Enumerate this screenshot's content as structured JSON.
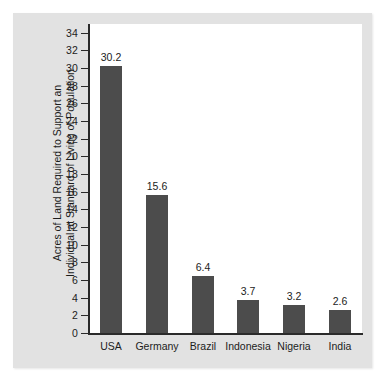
{
  "chart_data": {
    "type": "bar",
    "title": "",
    "subtitle": "",
    "xlabel": "",
    "ylabel": "Acres of Land Required to Support an Individual at Standard of Living of Population",
    "ylabel_lines": [
      "Acres of Land Required to Support an",
      "Individual at Standard of Living of Population"
    ],
    "categories": [
      "USA",
      "Germany",
      "Brazil",
      "Indonesia",
      "Nigeria",
      "India"
    ],
    "values": [
      30.2,
      15.6,
      6.4,
      3.7,
      3.2,
      2.6
    ],
    "value_labels": [
      "30.2",
      "15.6",
      "6.4",
      "3.7",
      "3.2",
      "2.6"
    ],
    "ylim": [
      0,
      35
    ],
    "ytick_labels": [
      "0",
      "2",
      "4",
      "6",
      "8",
      "10",
      "12",
      "14",
      "16",
      "18",
      "20",
      "22",
      "24",
      "26",
      "28",
      "30",
      "32",
      "34"
    ],
    "ytick_values": [
      0,
      2,
      4,
      6,
      8,
      10,
      12,
      14,
      16,
      18,
      20,
      22,
      24,
      26,
      28,
      30,
      32,
      34
    ],
    "grid": false,
    "legend": false,
    "legend_position": "none",
    "bar_color": "#4c4c4c",
    "panel_color": "#e2e2e2",
    "plot_background": "#ffffff",
    "axis_color": "#2b2b2b",
    "text_color": "#1c1c1c"
  }
}
